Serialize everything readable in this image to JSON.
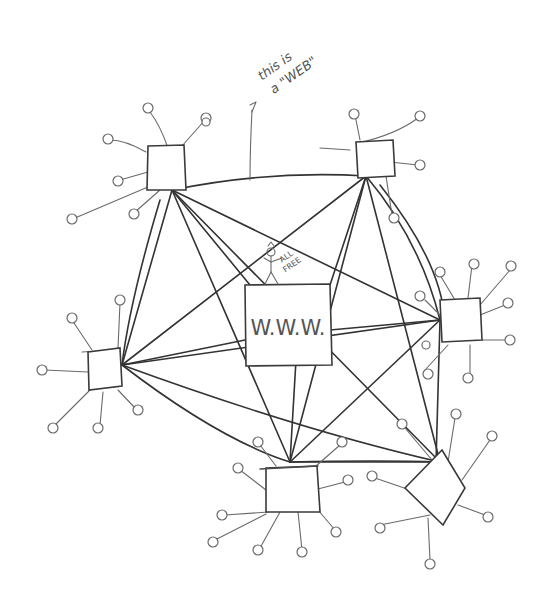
{
  "diagram": {
    "annotation": {
      "line1": "this is",
      "line2": "a \"WEB\"",
      "arrow": "-> points to top connection"
    },
    "center_node": {
      "label": "W.W.W."
    },
    "stick_figure": {
      "sign_line1": "ALL",
      "sign_line2": "FREE"
    },
    "nodes": [
      {
        "id": "top-left",
        "cx": 165,
        "cy": 166
      },
      {
        "id": "top-right",
        "cx": 377,
        "cy": 158
      },
      {
        "id": "right",
        "cx": 458,
        "cy": 320
      },
      {
        "id": "left",
        "cx": 106,
        "cy": 370
      },
      {
        "id": "bottom",
        "cx": 292,
        "cy": 492
      },
      {
        "id": "bottom-right",
        "cx": 434,
        "cy": 488
      }
    ],
    "ink_color": "#3a3a3a",
    "background": "#ffffff"
  }
}
